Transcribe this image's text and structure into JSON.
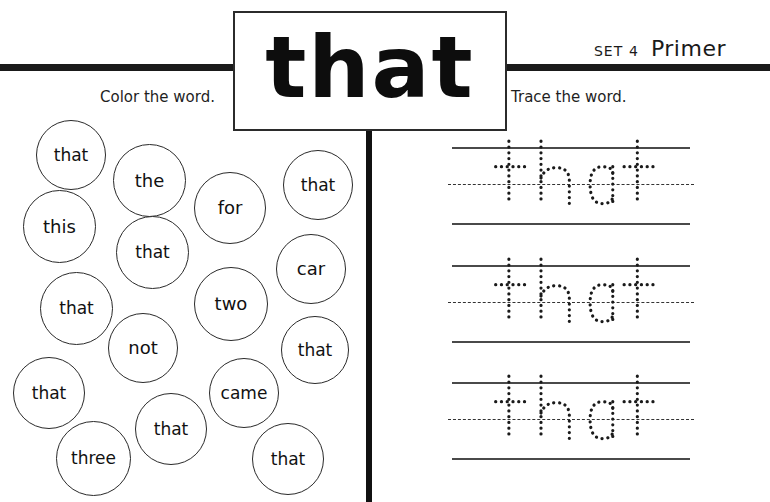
{
  "worksheet": {
    "title_word": "that",
    "set_prefix": "SET",
    "set_number": "4",
    "level": "Primer",
    "instructions": {
      "left": "Color the word.",
      "right": "Trace the word."
    },
    "colors": {
      "ink": "#111111",
      "rule": "#1a1a1a",
      "bubble_stroke": "#2a2a2a",
      "trace_line": "#4a4a4a",
      "paper": "#ffffff"
    }
  },
  "color_section": {
    "target_word": "that",
    "bubbles": [
      {
        "word": "that",
        "x": 36,
        "y": 120,
        "d": 70,
        "font": 17
      },
      {
        "word": "the",
        "x": 113,
        "y": 144,
        "d": 73,
        "font": 18
      },
      {
        "word": "this",
        "x": 23,
        "y": 190,
        "d": 73,
        "font": 18
      },
      {
        "word": "for",
        "x": 194,
        "y": 172,
        "d": 72,
        "font": 18
      },
      {
        "word": "that",
        "x": 283,
        "y": 150,
        "d": 70,
        "font": 17
      },
      {
        "word": "that",
        "x": 116,
        "y": 216,
        "d": 73,
        "font": 17
      },
      {
        "word": "that",
        "x": 40,
        "y": 272,
        "d": 73,
        "font": 17
      },
      {
        "word": "car",
        "x": 276,
        "y": 234,
        "d": 70,
        "font": 18
      },
      {
        "word": "two",
        "x": 194,
        "y": 267,
        "d": 74,
        "font": 18
      },
      {
        "word": "not",
        "x": 108,
        "y": 313,
        "d": 70,
        "font": 18
      },
      {
        "word": "that",
        "x": 281,
        "y": 316,
        "d": 68,
        "font": 17
      },
      {
        "word": "that",
        "x": 13,
        "y": 357,
        "d": 72,
        "font": 17
      },
      {
        "word": "came",
        "x": 209,
        "y": 358,
        "d": 70,
        "font": 17
      },
      {
        "word": "that",
        "x": 135,
        "y": 393,
        "d": 72,
        "font": 17
      },
      {
        "word": "three",
        "x": 56,
        "y": 421,
        "d": 75,
        "font": 17
      },
      {
        "word": "that",
        "x": 252,
        "y": 423,
        "d": 72,
        "font": 17
      }
    ]
  },
  "trace_section": {
    "word": "that",
    "rows": [
      {
        "label": "trace-row-1",
        "top": 147
      },
      {
        "label": "trace-row-2",
        "top": 265
      },
      {
        "label": "trace-row-3",
        "top": 382
      }
    ]
  }
}
